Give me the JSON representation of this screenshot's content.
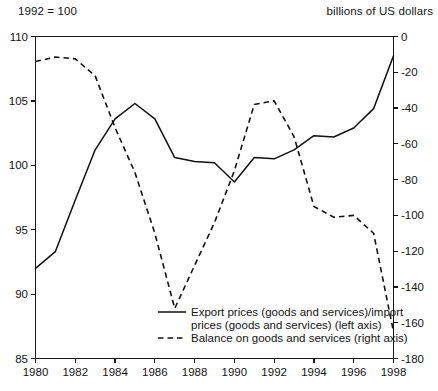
{
  "header": {
    "left_unit": "1992 = 100",
    "right_unit": "billions of US dollars"
  },
  "chart_data": {
    "type": "line",
    "title": "",
    "subtitle": "",
    "xlabel": "",
    "ylabel": "1992 = 100",
    "y2label": "billions of US dollars",
    "grid": false,
    "legend_position": "bottom-center",
    "xlim": [
      1980,
      1998
    ],
    "ylim": [
      85,
      110
    ],
    "y2lim": [
      -180,
      0
    ],
    "xticks": [
      1980,
      1982,
      1984,
      1986,
      1988,
      1990,
      1992,
      1994,
      1996,
      1998
    ],
    "xticklabels": [
      "1980",
      "1982",
      "1984",
      "1986",
      "1988",
      "1990",
      "1992",
      "1994",
      "1996",
      "1998"
    ],
    "yticks": [
      85,
      90,
      95,
      100,
      105,
      110
    ],
    "yticklabels": [
      "85",
      "90",
      "95",
      "100",
      "105",
      "110"
    ],
    "y2ticks": [
      -180,
      -160,
      -140,
      -120,
      -100,
      -80,
      -60,
      -40,
      -20,
      0
    ],
    "y2ticklabels": [
      "-180",
      "-160",
      "-140",
      "-120",
      "-100",
      "-80",
      "-60",
      "-40",
      "-20",
      "0"
    ],
    "x": [
      1980,
      1981,
      1982,
      1983,
      1984,
      1985,
      1986,
      1987,
      1988,
      1989,
      1990,
      1991,
      1992,
      1993,
      1994,
      1995,
      1996,
      1997,
      1998
    ],
    "series": [
      {
        "name": "Export prices (goods and services)/import prices (goods and services) (left axis)",
        "short_name": "export-import-price-ratio",
        "axis": "left",
        "style": "solid",
        "color": "#111111",
        "values": [
          92.0,
          93.3,
          97.3,
          101.2,
          103.6,
          104.8,
          103.6,
          100.6,
          100.3,
          100.2,
          98.7,
          100.6,
          100.5,
          101.2,
          102.3,
          102.2,
          102.9,
          104.4,
          108.5
        ]
      },
      {
        "name": "Balance on goods and services (right axis)",
        "short_name": "balance-goods-services",
        "axis": "right",
        "style": "dashed",
        "color": "#111111",
        "values": [
          -14.0,
          -11.5,
          -12.5,
          -22.0,
          -51.0,
          -76.0,
          -110.0,
          -152.0,
          -128.0,
          -104.0,
          -75.0,
          -38.0,
          -36.0,
          -56.0,
          -95.0,
          -101.0,
          -100.0,
          -110.0,
          -165.0
        ]
      }
    ],
    "legend": [
      {
        "label_line1": "Export prices (goods and services)/import",
        "label_line2": "prices (goods and services) (left axis)",
        "style": "solid"
      },
      {
        "label_line1": "Balance on goods and services (right axis)",
        "label_line2": "",
        "style": "dashed"
      }
    ]
  }
}
